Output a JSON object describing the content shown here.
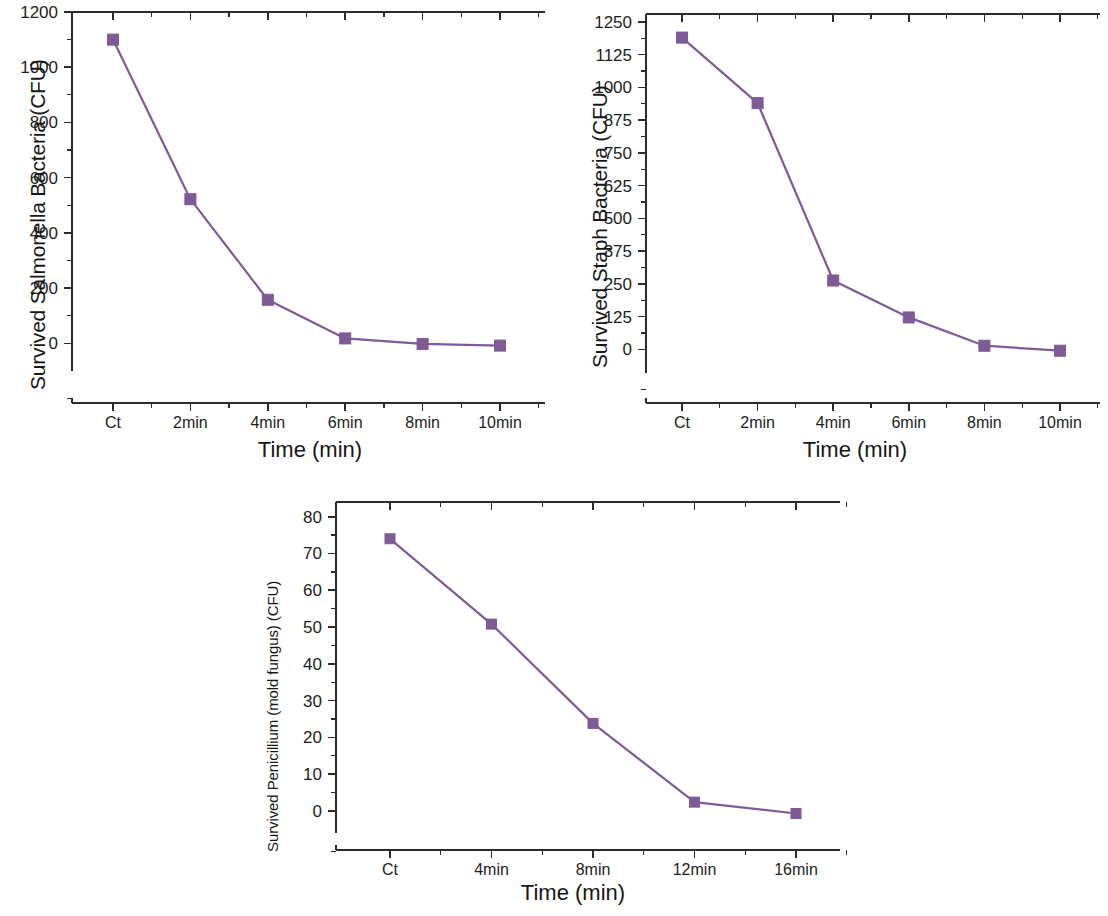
{
  "figure": {
    "background_color": "#ffffff",
    "series_color": "#7e5a96",
    "axis_color": "#2b2b2b",
    "marker_shape": "square"
  },
  "charts": [
    {
      "id": "salmonella",
      "panel_name": "chart-panel-salmonella",
      "xlabel": "Time (min)",
      "ylabel": "Survived Salmonella Bacteria (CFU)",
      "categories": [
        "Ct",
        "2min",
        "4min",
        "6min",
        "8min",
        "10min"
      ],
      "yticks": [
        "0",
        "200",
        "400",
        "600",
        "800",
        "1000",
        "1200"
      ],
      "values": [
        1100,
        522,
        158,
        18,
        -2,
        -8
      ]
    },
    {
      "id": "staph",
      "panel_name": "chart-panel-staph",
      "xlabel": "Time (min)",
      "ylabel": "Survived Staph Bacteria (CFU)",
      "categories": [
        "Ct",
        "2min",
        "4min",
        "6min",
        "8min",
        "10min"
      ],
      "yticks": [
        "0",
        "125",
        "250",
        "375",
        "500",
        "625",
        "750",
        "875",
        "1000",
        "1125",
        "1250"
      ],
      "values": [
        1190,
        940,
        263,
        122,
        14,
        -5
      ]
    },
    {
      "id": "penicillium",
      "panel_name": "chart-panel-penicillium",
      "xlabel": "Time (min)",
      "ylabel": "Survived Penicillium (mold fungus) (CFU)",
      "categories": [
        "Ct",
        "4min",
        "8min",
        "12min",
        "16min"
      ],
      "yticks": [
        "0",
        "10",
        "20",
        "30",
        "40",
        "50",
        "60",
        "70",
        "80"
      ],
      "values": [
        74,
        50.8,
        23.8,
        2.4,
        -0.7
      ]
    }
  ],
  "chart_data": [
    {
      "type": "line",
      "title": "",
      "xlabel": "Time (min)",
      "ylabel": "Survived Salmonella Bacteria (CFU)",
      "categories": [
        "Ct",
        "2min",
        "4min",
        "6min",
        "8min",
        "10min"
      ],
      "values": [
        1100,
        522,
        158,
        18,
        -2,
        -8
      ],
      "ylim": [
        -100,
        1200
      ],
      "ytick_values": [
        0,
        200,
        400,
        600,
        800,
        1000,
        1200
      ],
      "minor_tick_step": 100,
      "grid": false,
      "legend": "none",
      "marker": "square",
      "color": "#7e5a96"
    },
    {
      "type": "line",
      "title": "",
      "xlabel": "Time (min)",
      "ylabel": "Survived Staph Bacteria (CFU)",
      "categories": [
        "Ct",
        "2min",
        "4min",
        "6min",
        "8min",
        "10min"
      ],
      "values": [
        1190,
        940,
        263,
        122,
        14,
        -5
      ],
      "ylim": [
        -90,
        1280
      ],
      "ytick_values": [
        0,
        125,
        250,
        375,
        500,
        625,
        750,
        875,
        1000,
        1125,
        1250
      ],
      "minor_tick_step": 62.5,
      "grid": false,
      "legend": "none",
      "marker": "square",
      "color": "#7e5a96"
    },
    {
      "type": "line",
      "title": "",
      "xlabel": "Time (min)",
      "ylabel": "Survived Penicillium (mold fungus) (CFU)",
      "categories": [
        "Ct",
        "4min",
        "8min",
        "12min",
        "16min"
      ],
      "values": [
        74,
        50.8,
        23.8,
        2.4,
        -0.7
      ],
      "ylim": [
        -6,
        84
      ],
      "ytick_values": [
        0,
        10,
        20,
        30,
        40,
        50,
        60,
        70,
        80
      ],
      "minor_tick_step": 5,
      "grid": false,
      "legend": "none",
      "marker": "square",
      "color": "#7e5a96"
    }
  ]
}
